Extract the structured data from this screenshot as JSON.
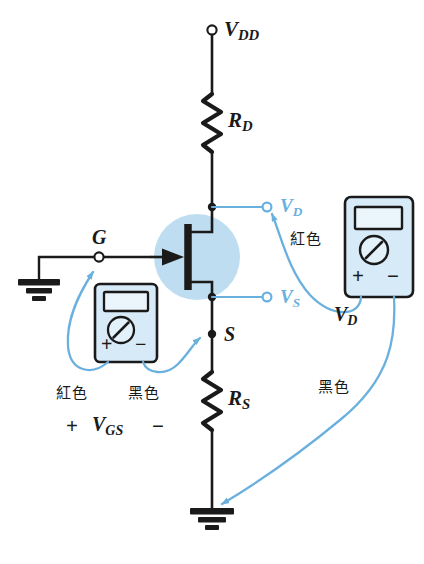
{
  "figure": {
    "background_color": "#ffffff",
    "ink_color": "#1a1a1a",
    "wire_color": "#6ab0de",
    "highlight_color": "#b8daf0",
    "meter_fill": "#d6eaf7"
  },
  "nodes": {
    "vdd": {
      "label": "V",
      "sub": "DD",
      "terminal": "open-circle"
    },
    "gate": {
      "label": "G",
      "terminal": "open-circle"
    },
    "source": {
      "label": "S",
      "terminal": "solid-dot"
    },
    "vd_probe": {
      "label": "V",
      "sub": "D",
      "terminal": "open-circle",
      "color": "#6ab0de"
    },
    "vs_probe": {
      "label": "V",
      "sub": "S",
      "terminal": "open-circle",
      "color": "#6ab0de"
    }
  },
  "components": {
    "rd": {
      "label": "R",
      "sub": "D",
      "type": "resistor-zigzag"
    },
    "rs": {
      "label": "R",
      "sub": "S",
      "type": "resistor-zigzag"
    },
    "transistor": {
      "type": "n-channel-jfet",
      "highlight": true
    },
    "ground_gate": {
      "type": "earth-ground"
    },
    "ground_bottom": {
      "type": "earth-ground"
    }
  },
  "meters": {
    "gate_meter": {
      "name": "VGS multimeter",
      "plus_label": "+",
      "minus_label": "−",
      "lead_red": "紅色",
      "lead_black": "黑色",
      "reading_label": "V",
      "reading_sub": "GS",
      "reading_plus": "+",
      "reading_minus": "−"
    },
    "drain_meter": {
      "name": "VD multimeter",
      "plus_label": "+",
      "minus_label": "−",
      "lead_red": "紅色",
      "lead_black": "黑色",
      "reading_label": "V",
      "reading_sub": "D"
    }
  },
  "annotations": {
    "red_wire_top": "紅色",
    "black_wire_right": "黑色",
    "red_wire_bottom": "紅色",
    "black_wire_bottom": "黑色"
  }
}
